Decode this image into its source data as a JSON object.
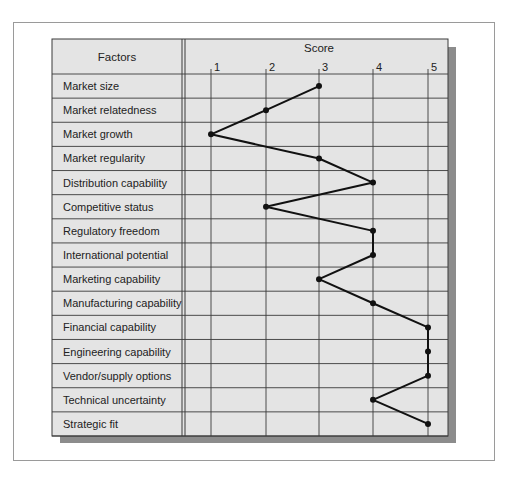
{
  "chart_data": {
    "type": "line",
    "title": "",
    "header": {
      "factors_label": "Factors",
      "score_label": "Score"
    },
    "xlabel": "Score",
    "ylabel": "Factors",
    "x_ticks": [
      1,
      2,
      3,
      4,
      5
    ],
    "xlim": [
      1,
      5
    ],
    "grid": true,
    "orientation": "horizontal-profile",
    "categories": [
      "Market size",
      "Market relatedness",
      "Market growth",
      "Market regularity",
      "Distribution capability",
      "Competitive status",
      "Regulatory freedom",
      "International potential",
      "Marketing capability",
      "Manufacturing capability",
      "Financial capability",
      "Engineering capability",
      "Vendor/supply options",
      "Technical uncertainty",
      "Strategic fit"
    ],
    "values": [
      3,
      2,
      1,
      3,
      4,
      2,
      4,
      4,
      3,
      4,
      5,
      5,
      5,
      4,
      5
    ]
  },
  "colors": {
    "table_fill": "#e4e4e4",
    "grid_line": "#3a3a3a",
    "profile_line": "#111111",
    "shadow": "#8c8c8c",
    "frame_border": "#9a9a9a"
  }
}
